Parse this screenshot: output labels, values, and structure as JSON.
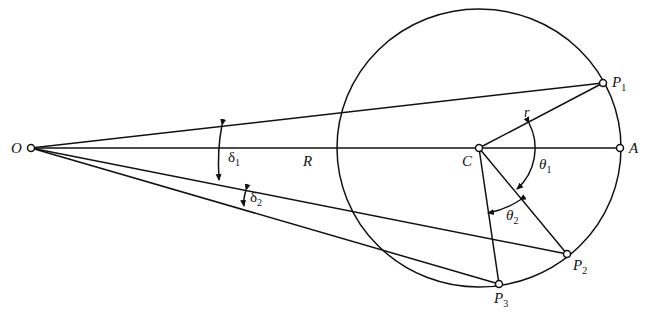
{
  "diagram": {
    "colors": {
      "stroke": "#111111",
      "background": "#ffffff"
    },
    "points": {
      "O": {
        "label": "O",
        "x": 31,
        "y": 148
      },
      "C": {
        "label": "C",
        "x": 479,
        "y": 148
      },
      "A": {
        "label": "A",
        "x": 620,
        "y": 148
      },
      "P1": {
        "label": "P",
        "sub": "1",
        "x": 603,
        "y": 83
      },
      "P2": {
        "label": "P",
        "sub": "2",
        "x": 567,
        "y": 254
      },
      "P3": {
        "label": "P",
        "sub": "3",
        "x": 499,
        "y": 284
      }
    },
    "circle": {
      "cx": 479,
      "cy": 148,
      "rx": 142,
      "ry": 139
    },
    "labels": {
      "O": "O",
      "C": "C",
      "A": "A",
      "R": "R",
      "r": "r",
      "P": "P",
      "p1_sub": "1",
      "p2_sub": "2",
      "p3_sub": "3",
      "delta": "δ",
      "delta1_sub": "1",
      "delta2_sub": "2",
      "theta": "θ",
      "theta1_sub": "1",
      "theta2_sub": "2"
    },
    "angles": [
      {
        "name": "delta_1",
        "between": [
          "OP1",
          "OP2"
        ]
      },
      {
        "name": "delta_2",
        "between": [
          "OP2",
          "OP3"
        ]
      },
      {
        "name": "theta_1",
        "between": [
          "CP1",
          "CP2"
        ]
      },
      {
        "name": "theta_2",
        "between": [
          "CP2",
          "CP3"
        ]
      }
    ]
  }
}
